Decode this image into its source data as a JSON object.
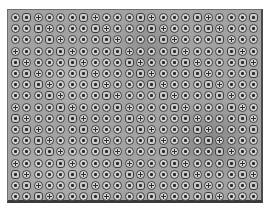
{
  "image": {
    "description": "Grayscale photo of a rectangular panel covered by a regular grid of small circular fixtures, each with a dark ring and dark center",
    "grid": {
      "columns": 22,
      "rows": 17
    },
    "colors": {
      "background": "#ffffff",
      "panel": "#a2a2a2",
      "cell_fill": "#d4d4d4",
      "cell_ring": "#3c3c3c",
      "frame_edge": "#3a3a3a"
    }
  }
}
